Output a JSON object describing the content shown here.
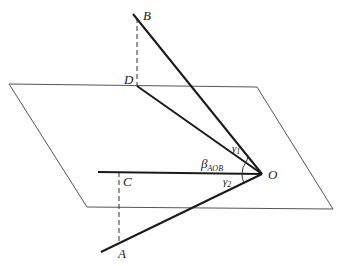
{
  "diagram": {
    "points": {
      "B": {
        "label": "B",
        "x": 133,
        "y": 14
      },
      "D": {
        "label": "D",
        "x": 137,
        "y": 86
      },
      "O": {
        "label": "O",
        "x": 262,
        "y": 174
      },
      "C": {
        "label": "C",
        "x": 119,
        "y": 172
      },
      "A": {
        "label": "A",
        "x": 119,
        "y": 241
      }
    },
    "angles": {
      "gamma1": {
        "label": "γ",
        "sub": "1"
      },
      "beta": {
        "label": "β",
        "sub": "AOB"
      },
      "gamma2": {
        "label": "γ",
        "sub": "2"
      }
    },
    "plane": {
      "corners": [
        [
          9,
          84
        ],
        [
          257,
          87
        ],
        [
          333,
          209
        ],
        [
          87,
          207
        ]
      ]
    },
    "colors": {
      "line": "#1a1a1a",
      "plane": "#555555"
    }
  }
}
